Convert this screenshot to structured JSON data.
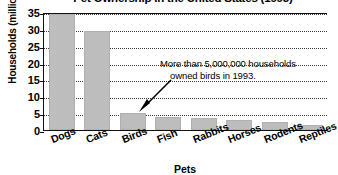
{
  "chart_data": {
    "type": "bar",
    "title": "Pet Ownership in the United States (1993)",
    "xlabel": "Pets",
    "ylabel": "Households (millions)",
    "categories": [
      "Dogs",
      "Cats",
      "Birds",
      "Fish",
      "Rabbits",
      "Horses",
      "Rodents",
      "Reptiles"
    ],
    "values": [
      34.5,
      29.5,
      5,
      4,
      3.5,
      3,
      2.5,
      1.5
    ],
    "ylim": [
      0,
      35
    ],
    "yticks": [
      0,
      5,
      10,
      15,
      20,
      25,
      30,
      35
    ],
    "ytick_labels": [
      "0",
      "5",
      "10",
      "15",
      "20",
      "25",
      "30",
      "35"
    ],
    "grid": true,
    "legend": false,
    "bar_color": "#bdbdbd",
    "annotations": [
      {
        "line1": "More than 5,000,000 households",
        "line2": "owned birds in 1993.",
        "points_to": "Birds"
      }
    ]
  }
}
